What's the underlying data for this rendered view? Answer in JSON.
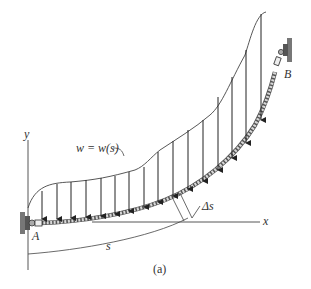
{
  "figure": {
    "caption": "(a)",
    "load_label": "w = w(s)",
    "point_a": "A",
    "point_b": "B",
    "axis_x": "x",
    "axis_y": "y",
    "arc_length": "s",
    "segment_length": "Δs"
  },
  "colors": {
    "ink": "#333333",
    "cable_fill": "#cfcfcf",
    "support_wall": "#777777"
  },
  "load_arrows_count": 15
}
